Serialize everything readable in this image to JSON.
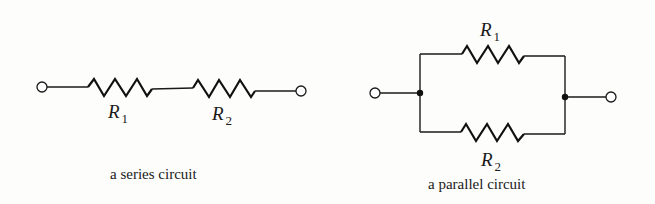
{
  "diagrams": {
    "series": {
      "caption": "a series circuit",
      "resistors": [
        {
          "symbol": "R",
          "subscript": "1"
        },
        {
          "symbol": "R",
          "subscript": "2"
        }
      ]
    },
    "parallel": {
      "caption": "a parallel circuit",
      "resistors": [
        {
          "symbol": "R",
          "subscript": "1"
        },
        {
          "symbol": "R",
          "subscript": "2"
        }
      ]
    }
  },
  "colors": {
    "ink": "#1a1a1a",
    "background": "#fdfdfc"
  }
}
